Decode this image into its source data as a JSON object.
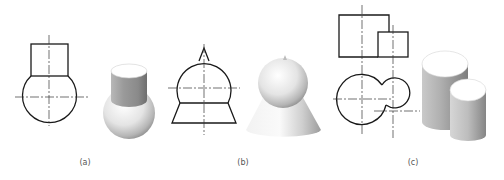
{
  "figures": [
    {
      "id": "a",
      "label": "(a)",
      "description": "Cylinder on top of sphere — orthographic front view and 3D rendering",
      "parts": [
        "cylinder",
        "sphere"
      ]
    },
    {
      "id": "b",
      "label": "(b)",
      "description": "Small cone on sphere on truncated cone — orthographic front view and 3D rendering",
      "parts": [
        "cone-tip",
        "sphere",
        "truncated-cone"
      ]
    },
    {
      "id": "c",
      "label": "(c)",
      "description": "Two intersecting cylinders of different sizes — front and top views plus 3D rendering",
      "parts": [
        "large-cylinder",
        "small-cylinder"
      ]
    }
  ],
  "colors": {
    "line": "#1a1a1a",
    "centerline": "#333333",
    "label": "#555555",
    "background": "#ffffff"
  }
}
